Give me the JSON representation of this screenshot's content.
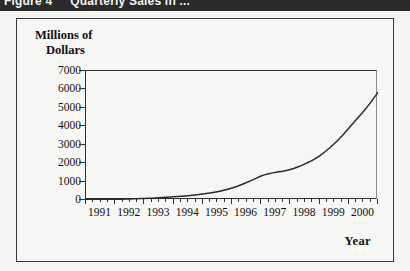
{
  "caption": {
    "figure_number": "Figure 4",
    "figure_title": "Quarterly Sales in ..."
  },
  "figure": {
    "y_axis_title_line1": "Millions of",
    "y_axis_title_line2": "Dollars",
    "x_axis_title": "Year"
  },
  "chart_data": {
    "type": "line",
    "title": "",
    "subtitle": "",
    "xlabel": "Year",
    "ylabel": "Millions of Dollars",
    "ylim": [
      0,
      7000
    ],
    "xlim": [
      1991,
      2001
    ],
    "grid": false,
    "legend": "none",
    "y_ticks": [
      0,
      1000,
      2000,
      3000,
      4000,
      5000,
      6000,
      7000
    ],
    "y_ticklabels": [
      "0",
      "1000",
      "2000",
      "3000",
      "4000",
      "5000",
      "6000",
      "7000"
    ],
    "x_ticks": [
      1991,
      1992,
      1993,
      1994,
      1995,
      1996,
      1997,
      1998,
      1999,
      2000
    ],
    "x_ticklabels": [
      "1991",
      "1992",
      "1993",
      "1994",
      "1995",
      "1996",
      "1997",
      "1998",
      "1999",
      "2000"
    ],
    "minor_tick_interval": "quarter",
    "series": [
      {
        "name": "Quarterly Sales",
        "color": "#2b2b2b",
        "x": [
          1991.0,
          1991.25,
          1991.5,
          1991.75,
          1992.0,
          1992.25,
          1992.5,
          1992.75,
          1993.0,
          1993.25,
          1993.5,
          1993.75,
          1994.0,
          1994.25,
          1994.5,
          1994.75,
          1995.0,
          1995.25,
          1995.5,
          1995.75,
          1996.0,
          1996.25,
          1996.5,
          1996.75,
          1997.0,
          1997.25,
          1997.5,
          1997.75,
          1998.0,
          1998.25,
          1998.5,
          1998.75,
          1999.0,
          1999.25,
          1999.5,
          1999.75,
          2000.0,
          2000.25,
          2000.5,
          2000.75,
          2001.0
        ],
        "values": [
          10,
          15,
          20,
          28,
          35,
          45,
          55,
          70,
          85,
          100,
          120,
          145,
          170,
          200,
          235,
          275,
          320,
          380,
          450,
          540,
          650,
          790,
          950,
          1120,
          1300,
          1420,
          1500,
          1560,
          1650,
          1790,
          1960,
          2150,
          2400,
          2700,
          3050,
          3450,
          3900,
          4350,
          4800,
          5300,
          5850
        ]
      }
    ]
  }
}
